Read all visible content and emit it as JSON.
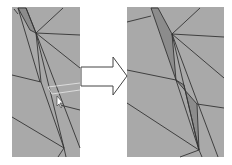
{
  "figure": {
    "panels": [
      {
        "name": "before",
        "has_cursor": true
      },
      {
        "name": "after",
        "has_cursor": false
      }
    ],
    "arrow": {
      "direction": "right"
    },
    "colors": {
      "mesh_fill": "#a9a9a9",
      "sliver_fill": "#8c8c8c",
      "edge": "#333333",
      "highlight": "#e8e8e8"
    }
  }
}
